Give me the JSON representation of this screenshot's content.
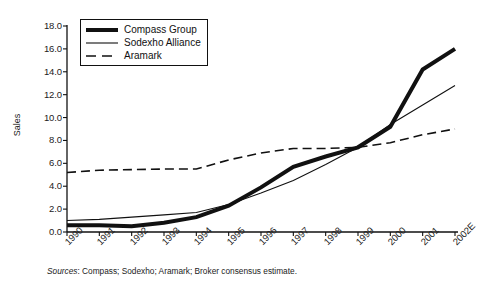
{
  "figure": {
    "source_note_lead": "Sources",
    "source_note_rest": ": Compass; Sodexho; Aramark; Broker consensus estimate."
  },
  "legend": {
    "position": "upper-left-inside",
    "items": [
      {
        "label": "Compass Group",
        "style": "thick-solid",
        "color": "#111111"
      },
      {
        "label": "Sodexho Alliance",
        "style": "thin-solid",
        "color": "#111111"
      },
      {
        "label": "Aramark",
        "style": "dashed",
        "color": "#111111"
      }
    ]
  },
  "chart_data": {
    "type": "line",
    "title": "",
    "subtitle": "",
    "xlabel": "",
    "ylabel": "Sales",
    "x": [
      "1990",
      "1991",
      "1992",
      "1993",
      "1994",
      "1995",
      "1996",
      "1997",
      "1998",
      "1999",
      "2000",
      "2001",
      "2002E"
    ],
    "xtick_labels": [
      "1990",
      "1991",
      "1992",
      "1993",
      "1994",
      "1995",
      "1996",
      "1997",
      "1998",
      "1999",
      "2000",
      "2001",
      "2002E"
    ],
    "ytick_labels": [
      "18.0",
      "16.0",
      "14.0",
      "12.0",
      "10.0",
      "8.0",
      "6.0",
      "4.0",
      "2.0",
      "0.0"
    ],
    "ytick_values": [
      18.0,
      16.0,
      14.0,
      12.0,
      10.0,
      8.0,
      6.0,
      4.0,
      2.0,
      0.0
    ],
    "ylim": [
      0.0,
      18.0
    ],
    "ystep": 2.0,
    "grid": false,
    "legend_position": "upper left",
    "series": [
      {
        "name": "Compass Group",
        "style": "thick-solid",
        "color": "#111111",
        "values": [
          0.6,
          0.6,
          0.5,
          0.8,
          1.3,
          2.3,
          3.9,
          5.7,
          6.6,
          7.4,
          9.2,
          14.2,
          16.0
        ]
      },
      {
        "name": "Sodexho Alliance",
        "style": "thin-solid",
        "color": "#111111",
        "values": [
          1.0,
          1.1,
          1.3,
          1.5,
          1.7,
          2.4,
          3.4,
          4.5,
          5.9,
          7.4,
          9.4,
          11.1,
          12.8
        ]
      },
      {
        "name": "Aramark",
        "style": "dashed",
        "color": "#111111",
        "values": [
          5.2,
          5.4,
          5.45,
          5.5,
          5.5,
          6.3,
          6.9,
          7.3,
          7.3,
          7.4,
          7.8,
          8.5,
          9.0
        ]
      }
    ]
  }
}
